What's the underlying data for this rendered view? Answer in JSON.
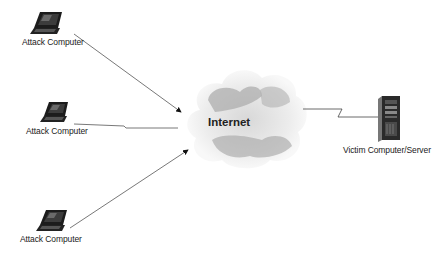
{
  "diagram": {
    "type": "network-attack-diagram",
    "nodes": [
      {
        "id": "attacker-1",
        "label": "Attack Computer",
        "icon": "laptop-icon"
      },
      {
        "id": "attacker-2",
        "label": "Attack Computer",
        "icon": "laptop-icon"
      },
      {
        "id": "attacker-3",
        "label": "Attack Computer",
        "icon": "laptop-icon"
      },
      {
        "id": "internet",
        "label": "Internet",
        "icon": "cloud-icon"
      },
      {
        "id": "victim",
        "label": "Victim Computer/Server",
        "icon": "server-tower-icon"
      }
    ],
    "edges": [
      {
        "from": "attacker-1",
        "to": "internet",
        "style": "arrow"
      },
      {
        "from": "attacker-2",
        "to": "internet",
        "style": "line"
      },
      {
        "from": "attacker-3",
        "to": "internet",
        "style": "arrow"
      },
      {
        "from": "internet",
        "to": "victim",
        "style": "zigzag-line"
      }
    ],
    "colors": {
      "line": "#555555",
      "cloud_light": "#e6e6e6",
      "cloud_dark": "#9a9a9a",
      "device": "#1c1c1c"
    }
  }
}
